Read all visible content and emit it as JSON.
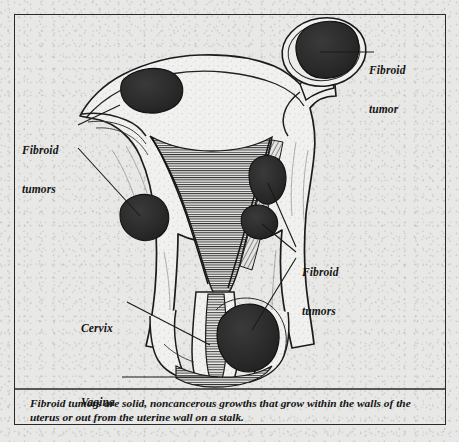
{
  "figure": {
    "background_color": "#e8e8e6",
    "ink_color": "#1a1a1a",
    "tumor_fill_color": "#2b2b2b",
    "tissue_fill_color": "#f2f2f0"
  },
  "labels": [
    {
      "id": "fibroid-tumor-pedunculated",
      "lines": [
        "Fibroid",
        "tumor"
      ],
      "text": "Fibroid tumor",
      "position": "top-right",
      "points_to": "pedunculated fibroid on stalk"
    },
    {
      "id": "fibroid-tumors-left",
      "lines": [
        "Fibroid",
        "tumors"
      ],
      "text": "Fibroid tumors",
      "position": "left",
      "points_to": "subserosal and intramural fibroids on left side"
    },
    {
      "id": "fibroid-tumors-right",
      "lines": [
        "Fibroid",
        "tumors"
      ],
      "text": "Fibroid tumors",
      "position": "right-middle",
      "points_to": "intramural and submucosal fibroids on right side"
    },
    {
      "id": "cervix",
      "lines": [
        "Cervix"
      ],
      "text": "Cervix",
      "position": "lower-left",
      "points_to": "cervix"
    },
    {
      "id": "vagina",
      "lines": [
        "Vagina"
      ],
      "text": "Vagina",
      "position": "bottom-left",
      "points_to": "vagina"
    }
  ],
  "tumors": [
    {
      "id": "tumor-fundus-left",
      "description": "subserosal fibroid in left fundus"
    },
    {
      "id": "tumor-pedunculated",
      "description": "pedunculated fibroid attached by a stalk at upper right"
    },
    {
      "id": "tumor-wall-left",
      "description": "intramural fibroid in left uterine wall"
    },
    {
      "id": "tumor-wall-right-upper",
      "description": "intramural fibroid in right uterine wall"
    },
    {
      "id": "tumor-wall-right-lower",
      "description": "submucosal fibroid in right uterine wall"
    },
    {
      "id": "tumor-cervical",
      "description": "large fibroid at lower uterine segment near cervix"
    }
  ],
  "anatomy": [
    {
      "id": "uterine-fundus",
      "name": "uterine fundus"
    },
    {
      "id": "uterine-cavity",
      "name": "uterine cavity / endometrium"
    },
    {
      "id": "cervix",
      "name": "cervix"
    },
    {
      "id": "cervical-canal",
      "name": "cervical canal"
    },
    {
      "id": "vagina",
      "name": "vagina"
    },
    {
      "id": "fallopian-tube-left",
      "name": "left fallopian tube"
    },
    {
      "id": "fallopian-tube-right",
      "name": "right fallopian tube"
    }
  ],
  "caption": {
    "text": "Fibroid tumors are solid, noncancerous growths that grow within the walls of the uterus or out from the uterine wall on a stalk."
  }
}
